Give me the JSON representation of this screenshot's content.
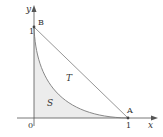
{
  "figure": {
    "axis_labels": {
      "x": "x",
      "y": "y"
    },
    "origin_label": "0",
    "ticks": {
      "x_one": "1",
      "y_one": "1"
    },
    "points": {
      "A": "A",
      "B": "B"
    },
    "regions": {
      "S": "S",
      "T": "T"
    },
    "colors": {
      "axis": "#555555",
      "line": "#8a8a8a",
      "curve": "#7a7a7a",
      "shade": "#ececec",
      "text": "#333333"
    }
  }
}
